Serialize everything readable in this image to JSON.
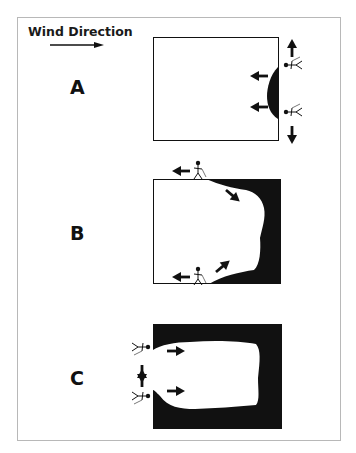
{
  "legend": {
    "title": "Wind Direction",
    "arrow_direction": "right"
  },
  "panels": [
    {
      "label": "A",
      "description": "Small dark patch at right (downwind) edge; two workers on right edge moving outward vertically; arrows point left (upwind)"
    },
    {
      "label": "B",
      "description": "Dark area expanded from right edge; workers on top and bottom edges moving left; arrows point inward diagonally"
    },
    {
      "label": "C",
      "description": "Dark area surrounds most of box; workers at left edge moving toward each other; arrows point right"
    }
  ],
  "colors": {
    "ink": "#111111",
    "frame": "#b8b8b8",
    "background": "#ffffff"
  }
}
